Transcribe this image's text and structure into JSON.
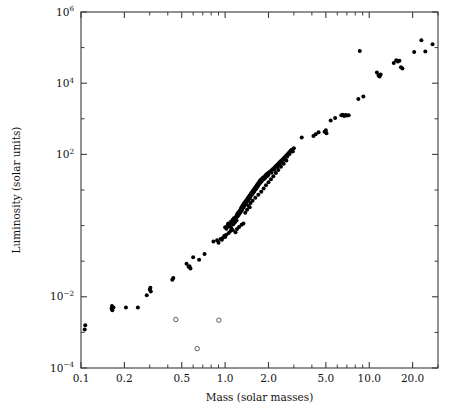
{
  "chart_data": {
    "type": "scatter",
    "title": "",
    "xlabel": "Mass (solar masses)",
    "ylabel": "Luminosity (solar units)",
    "xscale": "log",
    "yscale": "log",
    "xlim": [
      0.1,
      30.0
    ],
    "ylim": [
      0.0001,
      1000000
    ],
    "grid": false,
    "legend": null,
    "xticks": [
      {
        "value": 0.1,
        "label": "0.1"
      },
      {
        "value": 0.2,
        "label": "0.2"
      },
      {
        "value": 0.5,
        "label": "0.5"
      },
      {
        "value": 1.0,
        "label": "1.0"
      },
      {
        "value": 2.0,
        "label": "2.0"
      },
      {
        "value": 5.0,
        "label": "5.0"
      },
      {
        "value": 10.0,
        "label": "10.0"
      },
      {
        "value": 20.0,
        "label": "20.0"
      }
    ],
    "yticks": [
      {
        "value": 1000000,
        "mantissa": "10",
        "exponent": "6"
      },
      {
        "value": 10000,
        "mantissa": "10",
        "exponent": "4"
      },
      {
        "value": 100,
        "mantissa": "10",
        "exponent": "2"
      },
      {
        "value": 0.01,
        "mantissa": "10",
        "exponent": "−2"
      },
      {
        "value": 0.0001,
        "mantissa": "10",
        "exponent": "−4"
      }
    ],
    "yticks_minor": [
      100000,
      1000,
      10,
      1,
      0.1,
      0.001
    ],
    "colors": {
      "filled_marker": "#000000",
      "open_marker_fill": "#ffffff",
      "open_marker_stroke": "#4a4a4a",
      "axis": "#3a3a3a",
      "background": "#ffffff"
    },
    "series": [
      {
        "name": "main-sequence stars",
        "marker": "filled-circle",
        "points": [
          [
            0.106,
            0.0012
          ],
          [
            0.107,
            0.0016
          ],
          [
            0.163,
            0.0047
          ],
          [
            0.164,
            0.0055
          ],
          [
            0.165,
            0.0042
          ],
          [
            0.168,
            0.005
          ],
          [
            0.205,
            0.005
          ],
          [
            0.248,
            0.005
          ],
          [
            0.286,
            0.011
          ],
          [
            0.3,
            0.016
          ],
          [
            0.303,
            0.018
          ],
          [
            0.305,
            0.014
          ],
          [
            0.43,
            0.03
          ],
          [
            0.437,
            0.034
          ],
          [
            0.54,
            0.085
          ],
          [
            0.558,
            0.07
          ],
          [
            0.566,
            0.072
          ],
          [
            0.575,
            0.062
          ],
          [
            0.6,
            0.13
          ],
          [
            0.66,
            0.11
          ],
          [
            0.72,
            0.16
          ],
          [
            0.83,
            0.36
          ],
          [
            0.88,
            0.39
          ],
          [
            0.9,
            0.33
          ],
          [
            0.93,
            0.42
          ],
          [
            0.95,
            0.4
          ],
          [
            0.97,
            0.46
          ],
          [
            1.0,
            0.9
          ],
          [
            1.02,
            0.82
          ],
          [
            1.04,
            1.0
          ],
          [
            1.05,
            1.15
          ],
          [
            1.06,
            0.95
          ],
          [
            1.08,
            1.05
          ],
          [
            1.1,
            1.3
          ],
          [
            1.1,
            0.88
          ],
          [
            1.12,
            1.2
          ],
          [
            1.13,
            1.45
          ],
          [
            1.14,
            1.1
          ],
          [
            1.15,
            1.6
          ],
          [
            1.16,
            1.35
          ],
          [
            1.17,
            1.25
          ],
          [
            1.18,
            1.7
          ],
          [
            1.19,
            1.5
          ],
          [
            1.2,
            1.9
          ],
          [
            1.2,
            1.4
          ],
          [
            1.21,
            2.1
          ],
          [
            1.22,
            1.8
          ],
          [
            1.23,
            2.3
          ],
          [
            1.24,
            2.0
          ],
          [
            1.25,
            2.5
          ],
          [
            1.26,
            2.2
          ],
          [
            1.27,
            2.7
          ],
          [
            1.28,
            2.4
          ],
          [
            1.29,
            3.0
          ],
          [
            1.3,
            2.6
          ],
          [
            1.3,
            3.3
          ],
          [
            1.31,
            2.9
          ],
          [
            1.32,
            3.6
          ],
          [
            1.33,
            3.1
          ],
          [
            1.34,
            4.0
          ],
          [
            1.35,
            3.4
          ],
          [
            1.36,
            4.3
          ],
          [
            1.37,
            3.8
          ],
          [
            1.38,
            4.7
          ],
          [
            1.39,
            4.1
          ],
          [
            1.4,
            5.1
          ],
          [
            1.4,
            4.5
          ],
          [
            1.42,
            5.5
          ],
          [
            1.43,
            4.9
          ],
          [
            1.44,
            6.0
          ],
          [
            1.45,
            5.3
          ],
          [
            1.46,
            6.5
          ],
          [
            1.47,
            5.8
          ],
          [
            1.48,
            7.0
          ],
          [
            1.49,
            6.2
          ],
          [
            1.5,
            7.6
          ],
          [
            1.5,
            6.8
          ],
          [
            1.52,
            8.2
          ],
          [
            1.53,
            7.3
          ],
          [
            1.54,
            8.8
          ],
          [
            1.55,
            7.9
          ],
          [
            1.56,
            9.5
          ],
          [
            1.57,
            8.5
          ],
          [
            1.58,
            10.2
          ],
          [
            1.59,
            9.1
          ],
          [
            1.6,
            11.0
          ],
          [
            1.6,
            9.8
          ],
          [
            1.62,
            11.8
          ],
          [
            1.63,
            10.5
          ],
          [
            1.64,
            12.6
          ],
          [
            1.65,
            11.3
          ],
          [
            1.66,
            13.5
          ],
          [
            1.67,
            12.1
          ],
          [
            1.68,
            14.5
          ],
          [
            1.69,
            13.0
          ],
          [
            1.7,
            15.5
          ],
          [
            1.7,
            13.9
          ],
          [
            1.72,
            16.6
          ],
          [
            1.73,
            14.9
          ],
          [
            1.74,
            17.8
          ],
          [
            1.75,
            16.0
          ],
          [
            1.76,
            19.0
          ],
          [
            1.78,
            17.1
          ],
          [
            1.8,
            20.4
          ],
          [
            1.8,
            18.3
          ],
          [
            1.82,
            21.8
          ],
          [
            1.84,
            19.6
          ],
          [
            1.86,
            23.3
          ],
          [
            1.88,
            21.0
          ],
          [
            1.9,
            25.0
          ],
          [
            1.9,
            22.4
          ],
          [
            1.92,
            26.7
          ],
          [
            1.94,
            24.0
          ],
          [
            1.96,
            28.6
          ],
          [
            1.98,
            25.7
          ],
          [
            2.0,
            30.6
          ],
          [
            2.0,
            27.5
          ],
          [
            2.05,
            33.0
          ],
          [
            2.1,
            36.0
          ],
          [
            2.1,
            31.0
          ],
          [
            2.15,
            39.0
          ],
          [
            2.2,
            43.0
          ],
          [
            2.2,
            37.0
          ],
          [
            2.25,
            47.0
          ],
          [
            2.3,
            51.0
          ],
          [
            2.3,
            44.0
          ],
          [
            2.35,
            56.0
          ],
          [
            2.4,
            61.0
          ],
          [
            2.4,
            53.0
          ],
          [
            2.45,
            66.0
          ],
          [
            2.5,
            72.0
          ],
          [
            2.5,
            63.0
          ],
          [
            2.55,
            78.0
          ],
          [
            2.6,
            85.0
          ],
          [
            2.6,
            74.0
          ],
          [
            2.65,
            92.0
          ],
          [
            2.7,
            100.0
          ],
          [
            2.7,
            88.0
          ],
          [
            2.75,
            108.0
          ],
          [
            2.8,
            117.0
          ],
          [
            2.8,
            103.0
          ],
          [
            2.85,
            126.0
          ],
          [
            2.9,
            136.0
          ],
          [
            2.95,
            120.0
          ],
          [
            3.0,
            148.0
          ],
          [
            1.06,
            0.62
          ],
          [
            1.09,
            0.7
          ],
          [
            1.13,
            0.75
          ],
          [
            1.18,
            0.65
          ],
          [
            1.21,
            0.8
          ],
          [
            1.25,
            0.92
          ],
          [
            1.3,
            1.05
          ],
          [
            1.34,
            1.15
          ],
          [
            1.02,
            0.55
          ],
          [
            1.0,
            0.48
          ],
          [
            0.99,
            0.52
          ],
          [
            1.45,
            3.6
          ],
          [
            1.5,
            4.3
          ],
          [
            1.55,
            5.0
          ],
          [
            1.62,
            6.1
          ],
          [
            1.7,
            7.4
          ],
          [
            1.78,
            9.0
          ],
          [
            1.85,
            11.0
          ],
          [
            1.92,
            13.5
          ],
          [
            2.0,
            16.5
          ],
          [
            2.08,
            20.0
          ],
          [
            2.16,
            24.5
          ],
          [
            2.25,
            30.0
          ],
          [
            2.34,
            36.5
          ],
          [
            2.44,
            45.0
          ],
          [
            2.55,
            55.0
          ],
          [
            2.66,
            67.0
          ],
          [
            1.38,
            2.3
          ],
          [
            1.42,
            2.8
          ],
          [
            1.48,
            3.3
          ],
          [
            3.4,
            300.0
          ],
          [
            4.1,
            330.0
          ],
          [
            4.25,
            370.0
          ],
          [
            4.45,
            420.0
          ],
          [
            4.9,
            430.0
          ],
          [
            5.0,
            480.0
          ],
          [
            5.05,
            390.0
          ],
          [
            5.4,
            900.0
          ],
          [
            5.8,
            1050.0
          ],
          [
            6.4,
            1250.0
          ],
          [
            6.55,
            1300.0
          ],
          [
            6.7,
            1200.0
          ],
          [
            6.85,
            1280.0
          ],
          [
            7.0,
            1230.0
          ],
          [
            7.2,
            1260.0
          ],
          [
            8.4,
            3600.0
          ],
          [
            9.1,
            4200.0
          ],
          [
            8.6,
            80000.0
          ],
          [
            11.3,
            20000.0
          ],
          [
            11.6,
            16500.0
          ],
          [
            11.8,
            15500.0
          ],
          [
            12.0,
            17500.0
          ],
          [
            14.8,
            37000.0
          ],
          [
            15.4,
            44000.0
          ],
          [
            15.8,
            41000.0
          ],
          [
            16.2,
            42500.0
          ],
          [
            16.6,
            28000.0
          ],
          [
            17.0,
            26000.0
          ],
          [
            20.5,
            75000.0
          ],
          [
            23.0,
            160000.0
          ],
          [
            24.5,
            78000.0
          ],
          [
            27.5,
            125000.0
          ]
        ]
      },
      {
        "name": "outliers",
        "marker": "open-circle",
        "points": [
          [
            0.455,
            0.0023
          ],
          [
            0.905,
            0.0022
          ],
          [
            0.64,
            0.00035
          ]
        ]
      }
    ]
  },
  "figure": {
    "background_color": "#ffffff",
    "plot_box": {
      "left": 81,
      "top": 12,
      "right": 438,
      "bottom": 368
    }
  }
}
